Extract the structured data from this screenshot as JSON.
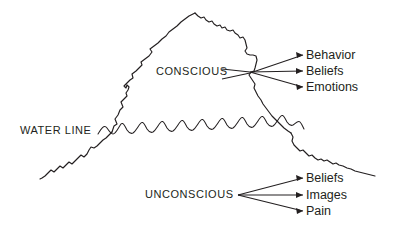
{
  "diagram": {
    "type": "iceberg-diagram",
    "colors": {
      "stroke": "#231f20",
      "background": "#ffffff"
    },
    "waterline_label": "WATER LINE",
    "regions": [
      {
        "id": "conscious",
        "label": "CONSCIOUS",
        "position": "above-water",
        "items": [
          "Behavior",
          "Beliefs",
          "Emotions"
        ]
      },
      {
        "id": "unconscious",
        "label": "UNCONSCIOUS",
        "position": "below-water",
        "items": [
          "Beliefs",
          "Images",
          "Pain"
        ]
      }
    ],
    "conscious_items": {
      "item_0": "Behavior",
      "item_1": "Beliefs",
      "item_2": "Emotions"
    },
    "unconscious_items": {
      "item_0": "Beliefs",
      "item_1": "Images",
      "item_2": "Pain"
    }
  }
}
